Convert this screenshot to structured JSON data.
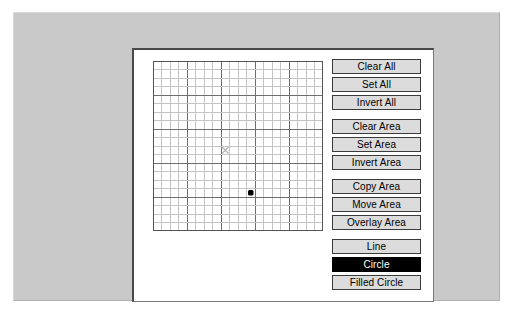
{
  "window": {
    "background_color": "#ffffff",
    "panel_color": "#c9c9c9",
    "dialog_color": "#ffffff"
  },
  "grid": {
    "columns": 20,
    "rows": 20,
    "cell_size_px": 8.5,
    "minor_line_color": "#c4c4c4",
    "major_line_color": "#6e6e6e",
    "major_every": 4,
    "border_color": "#555555",
    "cursor": {
      "icon": "x-cursor-icon",
      "col": 8,
      "row": 10,
      "color": "#b9b9b9"
    },
    "pixels": [
      {
        "col": 11,
        "row": 15,
        "color": "#000000"
      }
    ]
  },
  "buttons": {
    "groups": [
      {
        "name": "all-operations",
        "items": [
          {
            "label": "Clear All",
            "name": "clear-all-button",
            "selected": false
          },
          {
            "label": "Set All",
            "name": "set-all-button",
            "selected": false
          },
          {
            "label": "Invert All",
            "name": "invert-all-button",
            "selected": false
          }
        ]
      },
      {
        "name": "area-operations",
        "items": [
          {
            "label": "Clear Area",
            "name": "clear-area-button",
            "selected": false
          },
          {
            "label": "Set Area",
            "name": "set-area-button",
            "selected": false
          },
          {
            "label": "Invert Area",
            "name": "invert-area-button",
            "selected": false
          }
        ]
      },
      {
        "name": "area-transfer",
        "items": [
          {
            "label": "Copy Area",
            "name": "copy-area-button",
            "selected": false
          },
          {
            "label": "Move Area",
            "name": "move-area-button",
            "selected": false
          },
          {
            "label": "Overlay Area",
            "name": "overlay-area-button",
            "selected": false
          }
        ]
      },
      {
        "name": "drawing-tools",
        "items": [
          {
            "label": "Line",
            "name": "line-tool-button",
            "selected": false
          },
          {
            "label": "Circle",
            "name": "circle-tool-button",
            "selected": true
          },
          {
            "label": "Filled Circle",
            "name": "filled-circle-tool-button",
            "selected": false
          }
        ]
      }
    ]
  }
}
